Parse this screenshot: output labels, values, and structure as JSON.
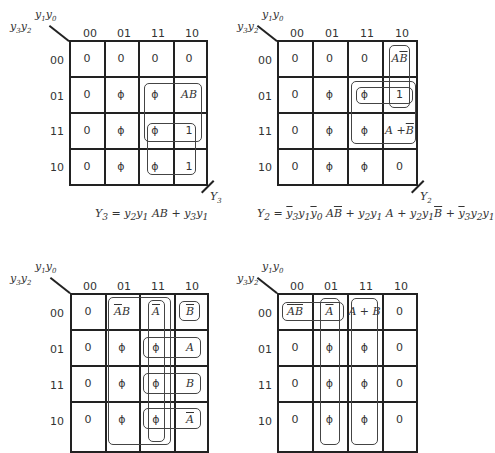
{
  "maps": [
    {
      "id": "Y3",
      "col_var": "y1y0",
      "row_var": "y3y2",
      "columns": [
        "00",
        "01",
        "11",
        "10"
      ],
      "rows": [
        "00",
        "01",
        "11",
        "10"
      ],
      "cells": [
        [
          "0",
          "0",
          "0",
          "0"
        ],
        [
          "0",
          "ϕ",
          "ϕ",
          "AB"
        ],
        [
          "0",
          "ϕ",
          "ϕ",
          "1"
        ],
        [
          "0",
          "ϕ",
          "ϕ",
          "1"
        ]
      ],
      "output_label": "Y3",
      "equation": "Y3 = y2 y1 AB + y3 y1"
    },
    {
      "id": "Y2",
      "col_var": "y1y0",
      "row_var": "y3y2",
      "columns": [
        "00",
        "01",
        "11",
        "10"
      ],
      "rows": [
        "00",
        "01",
        "11",
        "10"
      ],
      "cells": [
        [
          "0",
          "0",
          "0",
          "AB̄"
        ],
        [
          "0",
          "ϕ",
          "ϕ",
          "1"
        ],
        [
          "0",
          "ϕ",
          "ϕ",
          "A + B̄"
        ],
        [
          "0",
          "ϕ",
          "ϕ",
          "0"
        ]
      ],
      "output_label": "Y2",
      "equation": "Y2 = ȳ3 y1 ȳ0 AB̄ + y2 y1 A + y2 y1 B̄ + ȳ3 y2 y1"
    },
    {
      "id": "Y1",
      "col_var": "y1y0",
      "row_var": "y3y2",
      "columns": [
        "00",
        "01",
        "11",
        "10"
      ],
      "rows": [
        "00",
        "01",
        "11",
        "10"
      ],
      "cells": [
        [
          "0",
          "ĀB",
          "Ā",
          "B̄"
        ],
        [
          "0",
          "ϕ",
          "ϕ",
          "A"
        ],
        [
          "0",
          "ϕ",
          "ϕ",
          "B"
        ],
        [
          "0",
          "ϕ",
          "ϕ",
          "Ā"
        ]
      ],
      "output_label": ""
    },
    {
      "id": "Y0",
      "col_var": "y1y0",
      "row_var": "y3y2",
      "columns": [
        "00",
        "01",
        "11",
        "10"
      ],
      "rows": [
        "00",
        "01",
        "11",
        "10"
      ],
      "cells": [
        [
          "ĀB̄",
          "Ā",
          "A + B",
          "0"
        ],
        [
          "0",
          "ϕ",
          "ϕ",
          "0"
        ],
        [
          "0",
          "ϕ",
          "ϕ",
          "0"
        ],
        [
          "0",
          "ϕ",
          "ϕ",
          "0"
        ]
      ],
      "output_label": ""
    }
  ],
  "labels": {
    "y1": "y",
    "sub1": "1",
    "sub0": "0",
    "sub3": "3",
    "sub2": "2",
    "Y": "Y",
    "Y3sub": "3",
    "Y2sub": "2"
  },
  "equations": {
    "eq_y3": {
      "lhs": "Y",
      "lhs_sub": "3",
      "eq": " = ",
      "t1": "y",
      "t1s": "2",
      "t2": "y",
      "t2s": "1",
      "t3": " AB + ",
      "t4": "y",
      "t4s": "3",
      "t5": "y",
      "t5s": "1"
    },
    "eq_y2": {
      "lhs": "Y",
      "lhs_sub": "2",
      "eq": " = ",
      "a1": "y",
      "a1s": "3",
      "a2": "y",
      "a2s": "1",
      "a3": "y",
      "a3s": "0",
      "a4": " A",
      "a5": "B",
      "plus1": " + ",
      "b1": "y",
      "b1s": "2",
      "b2": "y",
      "b2s": "1",
      "b3": " A + ",
      "c1": "y",
      "c1s": "2",
      "c2": "y",
      "c2s": "1",
      "c3": "B",
      "plus3": " + ",
      "d1": "y",
      "d1s": "3",
      "d2": "y",
      "d2s": "2",
      "d3": "y",
      "d3s": "1"
    }
  }
}
